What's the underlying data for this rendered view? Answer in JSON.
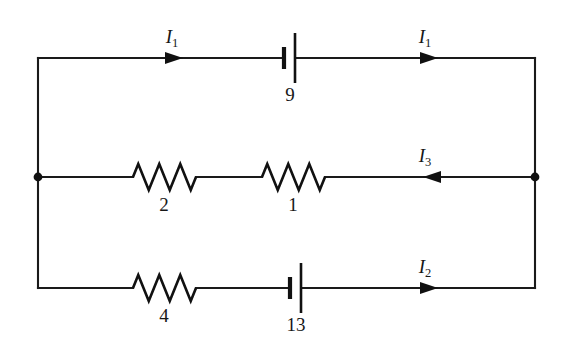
{
  "diagram": {
    "type": "circuit-schematic",
    "background_color": "#ffffff",
    "line_color": "#111111",
    "frame": {
      "left_x": 38,
      "right_x": 535,
      "top_y": 58,
      "middle_y": 177,
      "bottom_y": 288
    },
    "nodes": [
      {
        "name": "left-junction",
        "label": "",
        "x": 38,
        "y": 177
      },
      {
        "name": "right-junction",
        "label": "",
        "x": 535,
        "y": 177
      }
    ],
    "branches": [
      {
        "name": "top-branch",
        "y": 58,
        "components": [
          {
            "kind": "battery",
            "name": "battery-9",
            "label": "9",
            "x": 290,
            "label_x": 290,
            "label_y": 101
          }
        ],
        "currents": [
          {
            "name": "current-i1-left",
            "symbol": "I",
            "subscript": "1",
            "direction": "right",
            "arrow_x": 175,
            "label_x": 172,
            "label_y": 43
          },
          {
            "name": "current-i1-right",
            "symbol": "I",
            "subscript": "1",
            "direction": "right",
            "arrow_x": 430,
            "label_x": 425,
            "label_y": 43
          }
        ]
      },
      {
        "name": "middle-branch",
        "y": 177,
        "components": [
          {
            "kind": "resistor",
            "name": "resistor-2",
            "label": "2",
            "x_start": 133,
            "x_end": 196,
            "label_x": 164,
            "label_y": 211
          },
          {
            "kind": "resistor",
            "name": "resistor-1",
            "label": "1",
            "x_start": 262,
            "x_end": 325,
            "label_x": 293,
            "label_y": 211
          }
        ],
        "currents": [
          {
            "name": "current-i3",
            "symbol": "I",
            "subscript": "3",
            "direction": "left",
            "arrow_x": 432,
            "label_x": 425,
            "label_y": 162
          }
        ]
      },
      {
        "name": "bottom-branch",
        "y": 288,
        "components": [
          {
            "kind": "resistor",
            "name": "resistor-4",
            "label": "4",
            "x_start": 133,
            "x_end": 196,
            "label_x": 164,
            "label_y": 322
          },
          {
            "kind": "battery",
            "name": "battery-13",
            "label": "13",
            "x": 296,
            "label_x": 296,
            "label_y": 331
          }
        ],
        "currents": [
          {
            "name": "current-i2",
            "symbol": "I",
            "subscript": "2",
            "direction": "right",
            "arrow_x": 432,
            "label_x": 425,
            "label_y": 273
          }
        ]
      }
    ],
    "labels": {
      "battery_9": "9",
      "battery_13": "13",
      "resistor_2": "2",
      "resistor_1": "1",
      "resistor_4": "4",
      "current_1_symbol": "I",
      "current_1_sub": "1",
      "current_2_symbol": "I",
      "current_2_sub": "2",
      "current_3_symbol": "I",
      "current_3_sub": "3"
    }
  }
}
